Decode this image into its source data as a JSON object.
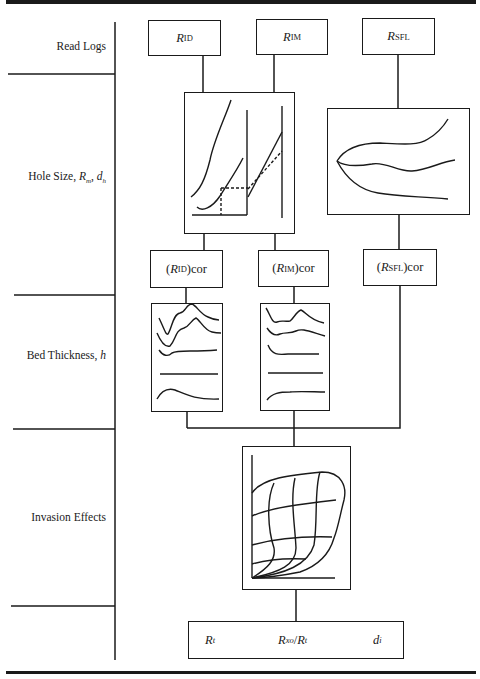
{
  "rows": [
    {
      "id": "read-logs",
      "label": "Read Logs"
    },
    {
      "id": "hole-size",
      "label": "Hole Size, ",
      "label_vars": "Rₘ, dₕ",
      "label_var1": "R",
      "label_var1_sub": "m",
      "label_var2": "d",
      "label_var2_sub": "h"
    },
    {
      "id": "bed-thickness",
      "label": "Bed Thickness, ",
      "label_var": "h"
    },
    {
      "id": "invasion-effects",
      "label": "Invasion Effects"
    }
  ],
  "log_boxes": [
    {
      "id": "rid",
      "symbol": "R",
      "sub": "ID"
    },
    {
      "id": "rim",
      "symbol": "R",
      "sub": "IM"
    },
    {
      "id": "rsfl",
      "symbol": "R",
      "sub": "SFL"
    }
  ],
  "corrected_boxes": [
    {
      "id": "rid-cor",
      "open": "(",
      "symbol": "R",
      "sub": "ID",
      "close": ")cor"
    },
    {
      "id": "rim-cor",
      "open": "(",
      "symbol": "R",
      "sub": "IM",
      "close": ")cor"
    },
    {
      "id": "rsfl-cor",
      "open": "(",
      "symbol": "R",
      "sub": "SFL",
      "close": ")cor"
    }
  ],
  "result_box": {
    "items": [
      {
        "id": "rt",
        "symbol": "R",
        "sub": "t"
      },
      {
        "id": "rxo-rt",
        "symbol": "R",
        "sub": "xo",
        "slash": "/",
        "symbol2": "R",
        "sub2": "t"
      },
      {
        "id": "di",
        "symbol": "d",
        "sub": "i"
      }
    ]
  },
  "colors": {
    "ink": "#1a1a1a",
    "background": "#ffffff"
  }
}
